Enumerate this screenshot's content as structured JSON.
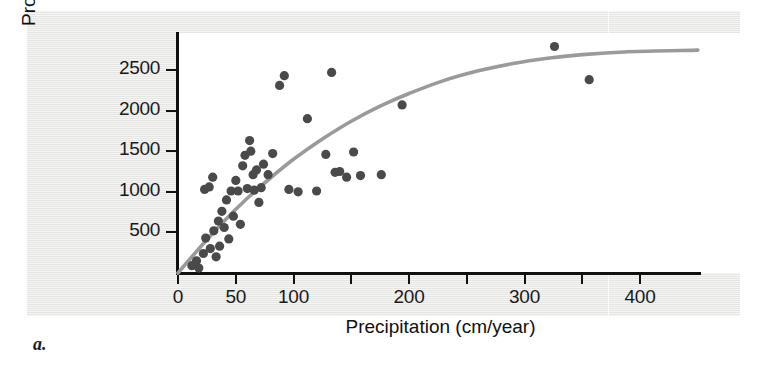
{
  "figure": {
    "panel_label": "a."
  },
  "chart_data": {
    "type": "scatter",
    "title": "",
    "xlabel": "Precipitation (cm/year)",
    "ylabel": "Productivity (g/m2/year)",
    "ylabel_parts": {
      "prefix": "Productivity (g/m",
      "exponent": "2",
      "suffix": "/year)"
    },
    "xlim": [
      0,
      450
    ],
    "ylim": [
      0,
      2900
    ],
    "grid": false,
    "legend": "none",
    "xticks": [
      0,
      50,
      100,
      150,
      200,
      250,
      300,
      350,
      400
    ],
    "xtick_labels": [
      "0",
      "50",
      "100",
      "",
      "200",
      "",
      "300",
      "",
      "400"
    ],
    "yticks": [
      500,
      1000,
      1500,
      2000,
      2500
    ],
    "ytick_labels": [
      "500",
      "1000",
      "1500",
      "2000",
      "2500"
    ],
    "point_color": "#4a4a4a",
    "curve_color": "#9a9a9a",
    "axis_color": "#111111",
    "points": [
      [
        12,
        90
      ],
      [
        16,
        150
      ],
      [
        18,
        60
      ],
      [
        22,
        240
      ],
      [
        23,
        1030
      ],
      [
        24,
        430
      ],
      [
        27,
        1060
      ],
      [
        28,
        300
      ],
      [
        30,
        1180
      ],
      [
        31,
        520
      ],
      [
        33,
        200
      ],
      [
        35,
        640
      ],
      [
        36,
        330
      ],
      [
        38,
        760
      ],
      [
        40,
        560
      ],
      [
        42,
        900
      ],
      [
        44,
        420
      ],
      [
        46,
        1010
      ],
      [
        48,
        700
      ],
      [
        50,
        1140
      ],
      [
        52,
        1010
      ],
      [
        54,
        600
      ],
      [
        56,
        1320
      ],
      [
        58,
        1450
      ],
      [
        60,
        1040
      ],
      [
        62,
        1630
      ],
      [
        63,
        1500
      ],
      [
        65,
        1210
      ],
      [
        66,
        1020
      ],
      [
        68,
        1270
      ],
      [
        70,
        870
      ],
      [
        72,
        1050
      ],
      [
        74,
        1340
      ],
      [
        78,
        1210
      ],
      [
        82,
        1470
      ],
      [
        88,
        2310
      ],
      [
        92,
        2430
      ],
      [
        96,
        1030
      ],
      [
        104,
        1000
      ],
      [
        112,
        1900
      ],
      [
        120,
        1010
      ],
      [
        128,
        1460
      ],
      [
        133,
        2470
      ],
      [
        136,
        1240
      ],
      [
        140,
        1250
      ],
      [
        146,
        1180
      ],
      [
        152,
        1490
      ],
      [
        158,
        1200
      ],
      [
        176,
        1210
      ],
      [
        194,
        2070
      ],
      [
        326,
        2790
      ],
      [
        356,
        2380
      ]
    ],
    "fitted_curve": {
      "description": "saturating (asymptotic) regression line",
      "points": [
        [
          0,
          0
        ],
        [
          20,
          330
        ],
        [
          40,
          640
        ],
        [
          60,
          920
        ],
        [
          80,
          1170
        ],
        [
          100,
          1400
        ],
        [
          125,
          1650
        ],
        [
          150,
          1870
        ],
        [
          175,
          2055
        ],
        [
          200,
          2210
        ],
        [
          230,
          2370
        ],
        [
          260,
          2490
        ],
        [
          290,
          2580
        ],
        [
          320,
          2645
        ],
        [
          350,
          2690
        ],
        [
          390,
          2725
        ],
        [
          450,
          2745
        ]
      ]
    }
  }
}
